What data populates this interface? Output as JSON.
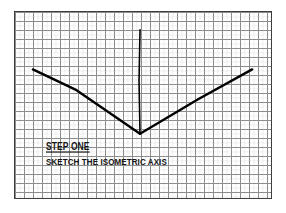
{
  "page": {
    "background_color": "#ffffff"
  },
  "graph_paper": {
    "name": "graph-paper-sheet",
    "border_color": "#3d3d3d",
    "grid_line_color": "#8c8c8c",
    "grid_cell_size_px": 9,
    "columns": 28,
    "rows": 21,
    "sheet_left_px": 14,
    "sheet_top_px": 11,
    "sheet_width_px": 258,
    "sheet_height_px": 188
  },
  "drawing": {
    "name": "isometric-axis",
    "stroke_color": "#000000",
    "arm_stroke_width_px": 2.4,
    "vertical_stroke_width_px": 1.6,
    "origin": {
      "x": 126,
      "y": 123
    },
    "strokes": [
      {
        "name": "left-isometric-arm",
        "description": "30 degree arm descending to the left vertex",
        "points": [
          {
            "x": 18,
            "y": 58
          },
          {
            "x": 62,
            "y": 79
          },
          {
            "x": 126,
            "y": 123
          }
        ]
      },
      {
        "name": "right-isometric-arm",
        "description": "30 degree arm ascending to the right",
        "points": [
          {
            "x": 126,
            "y": 123
          },
          {
            "x": 185,
            "y": 88
          },
          {
            "x": 239,
            "y": 58
          }
        ]
      },
      {
        "name": "vertical-axis",
        "description": "vertical axis rising from the origin",
        "points": [
          {
            "x": 126,
            "y": 123
          },
          {
            "x": 125,
            "y": 70
          },
          {
            "x": 126,
            "y": 18
          }
        ]
      }
    ]
  },
  "caption": {
    "name": "step-caption",
    "title": "STEP ONE",
    "subtitle": "SKETCH THE ISOMETRIC AXIS",
    "text_color": "#141414"
  }
}
